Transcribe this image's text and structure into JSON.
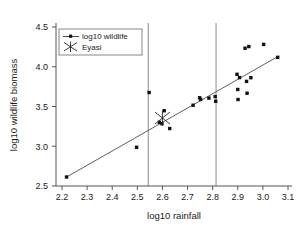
{
  "chart_data": {
    "type": "scatter",
    "title": "",
    "xlabel": "log10 rainfall",
    "ylabel": "log10 wildlife biomass",
    "xlim": [
      2.15,
      3.12
    ],
    "ylim": [
      2.45,
      4.55
    ],
    "xticks": [
      "2.2",
      "2.3",
      "2.4",
      "2.5",
      "2.6",
      "2.7",
      "2.8",
      "2.9",
      "3.0",
      "3.1"
    ],
    "xtick_values": [
      2.2,
      2.3,
      2.4,
      2.5,
      2.6,
      2.7,
      2.8,
      2.9,
      3.0,
      3.1
    ],
    "yticks": [
      "2.5",
      "3.0",
      "3.5",
      "4.0",
      "4.5"
    ],
    "ytick_values": [
      2.5,
      3.0,
      3.5,
      4.0,
      4.5
    ],
    "grid": false,
    "legend_position": "upper-left",
    "legend": [
      {
        "label": "log10 wildlife",
        "marker": "dot-with-line",
        "color": "#111111"
      },
      {
        "label": "Eyasi",
        "marker": "x-cross",
        "color": "#222222"
      }
    ],
    "series": [
      {
        "name": "log10 wildlife",
        "marker": "filled-square-dot",
        "color": "#111111",
        "points": [
          {
            "x": 2.218,
            "y": 2.613
          },
          {
            "x": 2.497,
            "y": 2.987
          },
          {
            "x": 2.547,
            "y": 3.676
          },
          {
            "x": 2.588,
            "y": 3.301
          },
          {
            "x": 2.598,
            "y": 3.283
          },
          {
            "x": 2.607,
            "y": 3.447
          },
          {
            "x": 2.629,
            "y": 3.223
          },
          {
            "x": 2.722,
            "y": 3.516
          },
          {
            "x": 2.748,
            "y": 3.61
          },
          {
            "x": 2.752,
            "y": 3.588
          },
          {
            "x": 2.785,
            "y": 3.606
          },
          {
            "x": 2.81,
            "y": 3.625
          },
          {
            "x": 2.812,
            "y": 3.566
          },
          {
            "x": 2.897,
            "y": 3.905
          },
          {
            "x": 2.9,
            "y": 3.714
          },
          {
            "x": 2.901,
            "y": 3.588
          },
          {
            "x": 2.907,
            "y": 3.864
          },
          {
            "x": 2.929,
            "y": 4.233
          },
          {
            "x": 2.935,
            "y": 3.816
          },
          {
            "x": 2.937,
            "y": 3.667
          },
          {
            "x": 2.944,
            "y": 4.254
          },
          {
            "x": 2.952,
            "y": 3.862
          },
          {
            "x": 3.003,
            "y": 4.281
          },
          {
            "x": 3.059,
            "y": 4.118
          }
        ]
      },
      {
        "name": "Eyasi",
        "marker": "x-cross",
        "color": "#222222",
        "points": [
          {
            "x": 2.6,
            "y": 3.355
          }
        ]
      }
    ],
    "fit_line": {
      "name": "regression-line",
      "x_start": 2.222,
      "y_start": 2.62,
      "x_end": 3.062,
      "y_end": 4.133,
      "color": "#4d4d4d"
    },
    "reference_lines": [
      {
        "name": "vline-lower",
        "x": 2.5435,
        "color": "#8a8a8a"
      },
      {
        "name": "vline-upper",
        "x": 2.8135,
        "color": "#8a8a8a"
      }
    ]
  }
}
